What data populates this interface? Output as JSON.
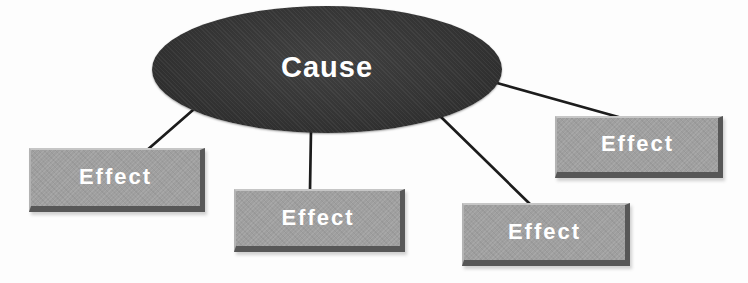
{
  "diagram": {
    "type": "cause-effect-map",
    "cause": {
      "label": "Cause"
    },
    "effects": [
      {
        "label": "Effect"
      },
      {
        "label": "Effect"
      },
      {
        "label": "Effect"
      },
      {
        "label": "Effect"
      }
    ],
    "colors": {
      "background": "#fdfdfd",
      "cause_fill": "#343434",
      "effect_face": "#9f9f9f",
      "effect_dark_edge": "#575757",
      "connector": "#1c1c1c",
      "node_text": "#ffffff"
    }
  }
}
